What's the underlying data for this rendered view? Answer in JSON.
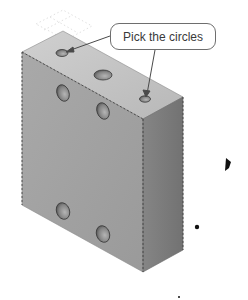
{
  "figure": {
    "type": "isometric-3d-part",
    "callout": {
      "text": "Pick the circles"
    },
    "part": {
      "shape": "rectangular block",
      "hole_count": 7,
      "colors": {
        "top_face": "#c4c4c4",
        "front_face": "#a3a3a3",
        "side_face": "#7d7d7d",
        "hole_fill": "#8a8a8a",
        "hole_edge": "#3a3a3a",
        "callout_border": "#6e6e6e",
        "leader_line": "#4a4a4a"
      }
    }
  }
}
